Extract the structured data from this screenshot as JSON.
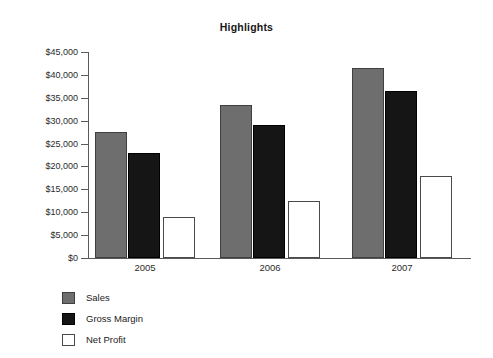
{
  "chart_data": {
    "type": "bar",
    "title": "Highlights",
    "xlabel": "",
    "ylabel": "",
    "categories": [
      "2005",
      "2006",
      "2007"
    ],
    "series": [
      {
        "name": "Sales",
        "color": "#6e6e6e",
        "values": [
          27500,
          33500,
          41500
        ]
      },
      {
        "name": "Gross Margin",
        "color": "#151515",
        "values": [
          23000,
          29000,
          36500
        ]
      },
      {
        "name": "Net Profit",
        "color": "#ffffff",
        "values": [
          9000,
          12500,
          18000
        ]
      }
    ],
    "ylim": [
      0,
      45000
    ],
    "ytick_values": [
      0,
      5000,
      10000,
      15000,
      20000,
      25000,
      30000,
      35000,
      40000,
      45000
    ],
    "ytick_labels": [
      "$0",
      "$5,000",
      "$10,000",
      "$15,000",
      "$20,000",
      "$25,000",
      "$30,000",
      "$35,000",
      "$40,000",
      "$45,000"
    ],
    "grid": false,
    "legend_position": "bottom-left",
    "legend_entries": [
      "Sales",
      "Gross Margin",
      "Net Profit"
    ],
    "axis_color": "#5a5a5a",
    "background_color": "#ffffff"
  },
  "layout": {
    "plot_left_px": 88,
    "plot_baseline_px": 258,
    "plot_top_px": 52,
    "group_starts_px": [
      95,
      220,
      352
    ],
    "bar_width_px": 32,
    "bar_gap_px": 1,
    "net_profit_offset_px": 68
  }
}
